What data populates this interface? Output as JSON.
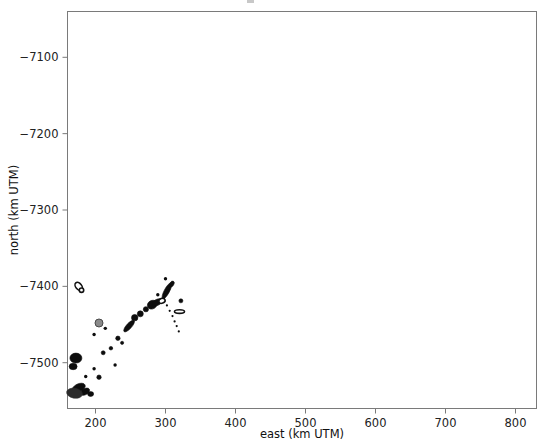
{
  "figure": {
    "background_color": "#ffffff",
    "frame_color": "#7a7a7a",
    "marker_color": "#0d0d0d"
  },
  "chart_data": {
    "type": "scatter",
    "title": "",
    "xlabel": "east (km UTM)",
    "ylabel": "north (km UTM)",
    "xlim": [
      160,
      830
    ],
    "ylim": [
      -7560,
      -7040
    ],
    "xticks": [
      200,
      300,
      400,
      500,
      600,
      700,
      800
    ],
    "xticklabels": [
      "200",
      "300",
      "400",
      "500",
      "600",
      "700",
      "800"
    ],
    "yticks": [
      -7100,
      -7200,
      -7300,
      -7400,
      -7500
    ],
    "yticklabels": [
      "−7100",
      "−7200",
      "−7300",
      "−7400",
      "−7500"
    ],
    "grid": false,
    "legend": null,
    "series": [
      {
        "name": "contour-blobs",
        "points": [
          {
            "x": 176,
            "y": -7400,
            "rx": 3.0,
            "ry": 4.5,
            "rot": -40,
            "style": "ring"
          },
          {
            "x": 180,
            "y": -7405,
            "rx": 2.2,
            "ry": 2.2,
            "rot": 0,
            "style": "ring"
          },
          {
            "x": 205,
            "y": -7448,
            "rx": 4.0,
            "ry": 4.0,
            "rot": 0,
            "style": "gray"
          },
          {
            "x": 232,
            "y": -7468,
            "rx": 2.2,
            "ry": 2.2,
            "rot": 0,
            "style": "fill"
          },
          {
            "x": 238,
            "y": -7474,
            "rx": 1.6,
            "ry": 1.6,
            "rot": 0,
            "style": "fill"
          },
          {
            "x": 248,
            "y": -7452,
            "rx": 7.5,
            "ry": 2.6,
            "rot": -48,
            "style": "fill"
          },
          {
            "x": 256,
            "y": -7441,
            "rx": 3.2,
            "ry": 3.2,
            "rot": 0,
            "style": "fill"
          },
          {
            "x": 264,
            "y": -7436,
            "rx": 3.0,
            "ry": 3.0,
            "rot": 0,
            "style": "fill"
          },
          {
            "x": 272,
            "y": -7430,
            "rx": 2.6,
            "ry": 2.6,
            "rot": 0,
            "style": "fill"
          },
          {
            "x": 281,
            "y": -7424,
            "rx": 5.0,
            "ry": 4.2,
            "rot": -30,
            "style": "fill"
          },
          {
            "x": 288,
            "y": -7421,
            "rx": 5.5,
            "ry": 3.0,
            "rot": -25,
            "style": "fill"
          },
          {
            "x": 295,
            "y": -7419,
            "rx": 3.2,
            "ry": 2.4,
            "rot": -20,
            "style": "ring"
          },
          {
            "x": 302,
            "y": -7406,
            "rx": 9.0,
            "ry": 2.6,
            "rot": -62,
            "style": "fill"
          },
          {
            "x": 309,
            "y": -7397,
            "rx": 3.2,
            "ry": 2.0,
            "rot": -60,
            "style": "fill"
          },
          {
            "x": 322,
            "y": -7419,
            "rx": 2.0,
            "ry": 2.0,
            "rot": 0,
            "style": "fill"
          },
          {
            "x": 320,
            "y": -7433,
            "rx": 5.0,
            "ry": 1.8,
            "rot": 0,
            "style": "ring"
          },
          {
            "x": 172,
            "y": -7494,
            "rx": 6.0,
            "ry": 5.0,
            "rot": 0,
            "style": "fill"
          },
          {
            "x": 168,
            "y": -7505,
            "rx": 4.0,
            "ry": 3.2,
            "rot": 0,
            "style": "fill"
          },
          {
            "x": 176,
            "y": -7533,
            "rx": 7.0,
            "ry": 4.0,
            "rot": -25,
            "style": "fill"
          },
          {
            "x": 185,
            "y": -7538,
            "rx": 5.0,
            "ry": 3.0,
            "rot": -30,
            "style": "fill"
          },
          {
            "x": 170,
            "y": -7540,
            "rx": 8.0,
            "ry": 5.0,
            "rot": 10,
            "style": "soft"
          },
          {
            "x": 193,
            "y": -7541,
            "rx": 3.0,
            "ry": 2.4,
            "rot": 0,
            "style": "fill"
          },
          {
            "x": 205,
            "y": -7519,
            "rx": 2.2,
            "ry": 2.2,
            "rot": 0,
            "style": "fill"
          },
          {
            "x": 211,
            "y": -7487,
            "rx": 2.0,
            "ry": 2.0,
            "rot": 0,
            "style": "fill"
          },
          {
            "x": 222,
            "y": -7481,
            "rx": 1.8,
            "ry": 1.8,
            "rot": 0,
            "style": "fill"
          }
        ]
      },
      {
        "name": "dotted-branch",
        "points": [
          {
            "x": 302,
            "y": -7425
          },
          {
            "x": 306,
            "y": -7432
          },
          {
            "x": 310,
            "y": -7439
          },
          {
            "x": 313,
            "y": -7446
          },
          {
            "x": 316,
            "y": -7452
          },
          {
            "x": 319,
            "y": -7459
          }
        ]
      },
      {
        "name": "scattered-dots",
        "points": [
          {
            "x": 198,
            "y": -7463
          },
          {
            "x": 214,
            "y": -7455
          },
          {
            "x": 186,
            "y": -7518
          },
          {
            "x": 198,
            "y": -7508
          },
          {
            "x": 228,
            "y": -7503
          },
          {
            "x": 300,
            "y": -7390
          },
          {
            "x": 289,
            "y": -7411
          }
        ]
      }
    ]
  }
}
